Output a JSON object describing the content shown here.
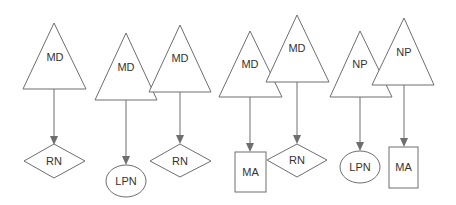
{
  "diagram": {
    "type": "hierarchy-pairs",
    "pairs": [
      {
        "supervisor": {
          "label": "MD",
          "shape": "triangle",
          "apex": [
            54,
            23
          ],
          "base_y": 89,
          "base_x": [
            23,
            86
          ]
        },
        "subordinate": {
          "label": "RN",
          "shape": "diamond",
          "cx": 54,
          "cy": 161,
          "w": 61,
          "h": 34
        }
      },
      {
        "supervisor": {
          "label": "MD",
          "shape": "triangle",
          "apex": [
            126,
            33
          ],
          "base_y": 100,
          "base_x": [
            95,
            157
          ]
        },
        "subordinate": {
          "label": "LPN",
          "shape": "ellipse",
          "cx": 126,
          "cy": 181,
          "rx": 20,
          "ry": 16
        }
      },
      {
        "supervisor": {
          "label": "MD",
          "shape": "triangle",
          "apex": [
            180,
            25
          ],
          "base_y": 92,
          "base_x": [
            149,
            211
          ]
        },
        "subordinate": {
          "label": "RN",
          "shape": "diamond",
          "cx": 180,
          "cy": 161,
          "w": 61,
          "h": 34
        }
      },
      {
        "supervisor": {
          "label": "MD",
          "shape": "triangle",
          "apex": [
            250,
            31
          ],
          "base_y": 97,
          "base_x": [
            219,
            282
          ]
        },
        "subordinate": {
          "label": "MA",
          "shape": "rectangle",
          "x": 235,
          "y": 152,
          "w": 31,
          "h": 40
        }
      },
      {
        "supervisor": {
          "label": "MD",
          "shape": "triangle",
          "apex": [
            297,
            15
          ],
          "base_y": 82,
          "base_x": [
            266,
            329
          ]
        },
        "subordinate": {
          "label": "RN",
          "shape": "diamond",
          "cx": 297,
          "cy": 160,
          "w": 61,
          "h": 34
        }
      },
      {
        "supervisor": {
          "label": "NP",
          "shape": "triangle",
          "apex": [
            360,
            31
          ],
          "base_y": 97,
          "base_x": [
            330,
            392
          ]
        },
        "subordinate": {
          "label": "LPN",
          "shape": "ellipse",
          "cx": 360,
          "cy": 167,
          "rx": 20,
          "ry": 16
        }
      },
      {
        "supervisor": {
          "label": "NP",
          "shape": "triangle",
          "apex": [
            404,
            18
          ],
          "base_y": 85,
          "base_x": [
            372,
            434
          ]
        },
        "subordinate": {
          "label": "MA",
          "shape": "rectangle",
          "x": 389,
          "y": 147,
          "w": 29,
          "h": 41
        }
      }
    ]
  },
  "labels": {
    "t1": "MD",
    "t2": "MD",
    "t3": "MD",
    "t4": "MD",
    "t5": "MD",
    "t6": "NP",
    "t7": "NP",
    "s1": "RN",
    "s2": "LPN",
    "s3": "RN",
    "s4": "MA",
    "s5": "RN",
    "s6": "LPN",
    "s7": "MA"
  },
  "colors": {
    "stroke": "#6e6e6e",
    "text": "#333333",
    "background": "#ffffff"
  }
}
